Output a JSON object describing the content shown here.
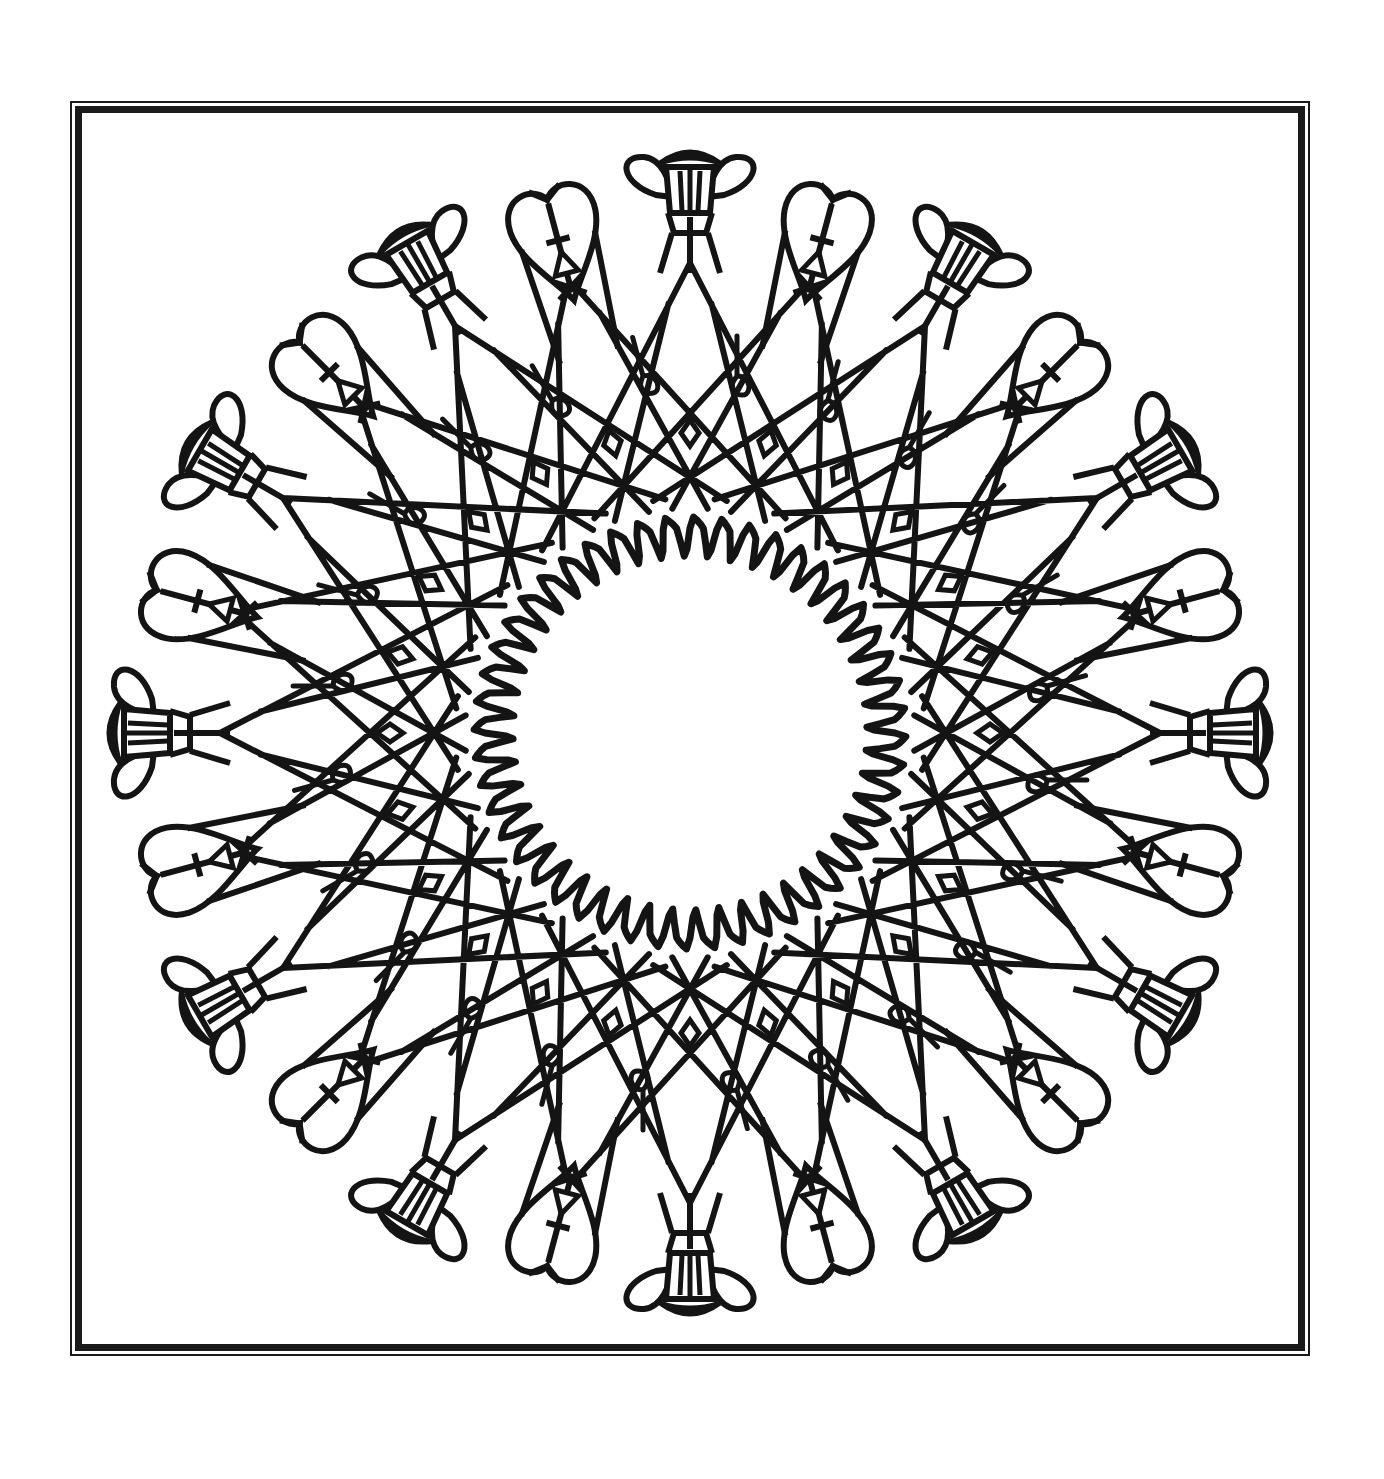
{
  "page": {
    "background": "#ffffff",
    "ink": "#141414"
  },
  "frame": {
    "outer": {
      "x": 70,
      "y": 101,
      "w": 1240,
      "h": 1255,
      "stroke": 2
    },
    "inner": {
      "x": 75,
      "y": 106,
      "w": 1230,
      "h": 1245,
      "stroke": 7
    }
  },
  "mandala": {
    "center": {
      "x": 690,
      "y": 733
    },
    "motif_count": 24,
    "motif_pattern": [
      "flower",
      "heart",
      "flower",
      "heart"
    ],
    "outer_radius": 560,
    "flower_radius": 530,
    "heart_radius": 500,
    "lattice_outer_radius": 470,
    "lattice_inner_radius": 215,
    "wavy_inner_radius": 200,
    "wavy_amplitude": 18,
    "wavy_peaks": 48,
    "stroke_width": 7,
    "diamond_radius": 300,
    "hook_radius": 360
  }
}
